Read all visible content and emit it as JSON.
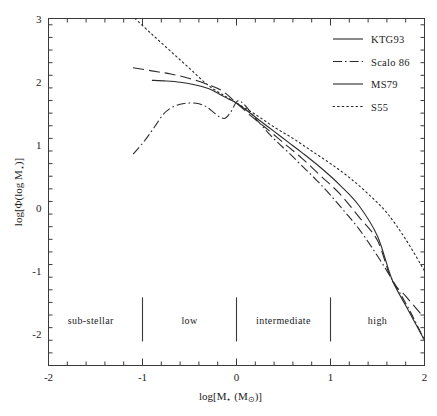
{
  "figure": {
    "background_color": "#ffffff",
    "ink_color": "#2b2b2b"
  },
  "chart_data": {
    "type": "line",
    "title": "",
    "subtitle": "",
    "xlabel": "log[M⋆ (M⊙)]",
    "ylabel": "log[Φ(log M⋆)]",
    "xlim": [
      -2,
      2
    ],
    "ylim": [
      -2.5,
      3
    ],
    "xticks": [
      -2,
      -1,
      0,
      1,
      2
    ],
    "xtick_labels": [
      "-2",
      "-1",
      "0",
      "1",
      "2"
    ],
    "yticks": [
      -2,
      -1,
      0,
      1,
      2,
      3
    ],
    "ytick_labels": [
      "-2",
      "-1",
      "0",
      "1",
      "2",
      "3"
    ],
    "xminor_step": 0.2,
    "yminor_step": 0.2,
    "grid": false,
    "legend_position": "upper-right",
    "series": [
      {
        "name": "KTG93",
        "style": "long-dash",
        "points": [
          [
            -1.1,
            2.22
          ],
          [
            -0.9,
            2.17
          ],
          [
            -0.7,
            2.12
          ],
          [
            -0.5,
            2.05
          ],
          [
            -0.3,
            1.95
          ],
          [
            -0.15,
            1.85
          ],
          [
            0.0,
            1.66
          ],
          [
            0.15,
            1.46
          ],
          [
            0.3,
            1.28
          ],
          [
            0.5,
            1.03
          ],
          [
            0.7,
            0.78
          ],
          [
            0.9,
            0.5
          ],
          [
            1.1,
            0.22
          ],
          [
            1.3,
            -0.14
          ],
          [
            1.5,
            -0.52
          ],
          [
            1.65,
            -1.14
          ],
          [
            1.8,
            -1.4
          ],
          [
            2.0,
            -1.75
          ]
        ]
      },
      {
        "name": "Scalo 86",
        "style": "dash-dot",
        "points": [
          [
            -1.1,
            0.85
          ],
          [
            -1.0,
            1.02
          ],
          [
            -0.92,
            1.18
          ],
          [
            -0.85,
            1.33
          ],
          [
            -0.78,
            1.48
          ],
          [
            -0.7,
            1.58
          ],
          [
            -0.6,
            1.64
          ],
          [
            -0.5,
            1.66
          ],
          [
            -0.4,
            1.65
          ],
          [
            -0.32,
            1.6
          ],
          [
            -0.25,
            1.52
          ],
          [
            -0.18,
            1.44
          ],
          [
            -0.12,
            1.42
          ],
          [
            -0.06,
            1.52
          ],
          [
            -0.02,
            1.63
          ],
          [
            0.02,
            1.7
          ],
          [
            0.08,
            1.64
          ],
          [
            0.18,
            1.46
          ],
          [
            0.3,
            1.25
          ],
          [
            0.42,
            1.06
          ],
          [
            0.55,
            0.88
          ],
          [
            0.7,
            0.66
          ],
          [
            0.85,
            0.44
          ],
          [
            1.0,
            0.2
          ],
          [
            1.15,
            -0.06
          ],
          [
            1.3,
            -0.33
          ],
          [
            1.45,
            -0.65
          ],
          [
            1.6,
            -1.0
          ],
          [
            1.7,
            -1.25
          ],
          [
            1.85,
            -1.65
          ],
          [
            2.0,
            -2.1
          ]
        ]
      },
      {
        "name": "MS79",
        "style": "solid",
        "points": [
          [
            -0.9,
            2.02
          ],
          [
            -0.75,
            2.01
          ],
          [
            -0.6,
            1.99
          ],
          [
            -0.45,
            1.95
          ],
          [
            -0.3,
            1.89
          ],
          [
            -0.18,
            1.8
          ],
          [
            -0.08,
            1.72
          ],
          [
            0.0,
            1.66
          ],
          [
            0.12,
            1.53
          ],
          [
            0.25,
            1.38
          ],
          [
            0.4,
            1.21
          ],
          [
            0.55,
            1.04
          ],
          [
            0.7,
            0.87
          ],
          [
            0.9,
            0.63
          ],
          [
            1.1,
            0.36
          ],
          [
            1.3,
            0.04
          ],
          [
            1.5,
            -0.45
          ],
          [
            1.65,
            -1.12
          ],
          [
            1.8,
            -1.55
          ],
          [
            2.0,
            -2.1
          ]
        ]
      },
      {
        "name": "S55",
        "style": "dotted",
        "points": [
          [
            -1.08,
            3.0
          ],
          [
            -0.9,
            2.75
          ],
          [
            -0.7,
            2.48
          ],
          [
            -0.5,
            2.21
          ],
          [
            -0.3,
            1.94
          ],
          [
            -0.1,
            1.75
          ],
          [
            0.0,
            1.66
          ],
          [
            0.2,
            1.48
          ],
          [
            0.4,
            1.28
          ],
          [
            0.6,
            1.1
          ],
          [
            0.8,
            0.9
          ],
          [
            1.0,
            0.7
          ],
          [
            1.2,
            0.48
          ],
          [
            1.4,
            0.22
          ],
          [
            1.6,
            -0.08
          ],
          [
            1.8,
            -0.5
          ],
          [
            2.0,
            -1.0
          ]
        ]
      }
    ],
    "annotations": [
      {
        "text": "sub-stellar",
        "x": -1.55,
        "y": -1.78
      },
      {
        "text": "low",
        "x": -0.5,
        "y": -1.78
      },
      {
        "text": "intermediate",
        "x": 0.5,
        "y": -1.78
      },
      {
        "text": "high",
        "x": 1.5,
        "y": -1.78
      }
    ],
    "dividers": [
      -1.0,
      0.0,
      1.0
    ]
  },
  "legend": {
    "entries": [
      {
        "label": "KTG93",
        "style": "long-dash"
      },
      {
        "label": "Scalo 86",
        "style": "dash-dot"
      },
      {
        "label": "MS79",
        "style": "solid"
      },
      {
        "label": "S55",
        "style": "dotted"
      }
    ]
  },
  "axes": {
    "x_title_main": "log[M",
    "x_title_sub1": "⋆",
    "x_title_mid": " (M",
    "x_title_sub2": "⊙",
    "x_title_end": ")]",
    "y_title": "log[Φ(log M⋆)]"
  }
}
